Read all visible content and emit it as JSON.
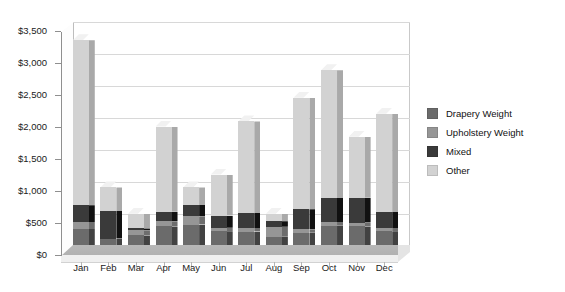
{
  "chart_data": {
    "type": "bar",
    "subtype": "stacked-column-3d",
    "title": "",
    "xlabel": "",
    "ylabel": "",
    "categories": [
      "Jan",
      "Feb",
      "Mar",
      "Apr",
      "May",
      "Jun",
      "Jul",
      "Aug",
      "Sep",
      "Oct",
      "Nov",
      "Dec"
    ],
    "ylim": [
      0,
      3500
    ],
    "ytick_values": [
      0,
      500,
      1000,
      1500,
      2000,
      2500,
      3000,
      3500
    ],
    "ytick_labels": [
      "$0",
      "$500",
      "$1,000",
      "$1,500",
      "$2,000",
      "$2,500",
      "$3,000",
      "$3,500"
    ],
    "grid": true,
    "grid_axis": "y",
    "legend_position": "right",
    "currency_prefix": "$",
    "series": [
      {
        "name": "Drapery Weight",
        "color": "#6b6b6b",
        "values": [
          250,
          100,
          150,
          290,
          320,
          215,
          210,
          130,
          190,
          300,
          290,
          215
        ]
      },
      {
        "name": "Upholstery Weight",
        "color": "#969696",
        "values": [
          110,
          0,
          80,
          80,
          130,
          55,
          55,
          155,
          55,
          60,
          60,
          50
        ]
      },
      {
        "name": "Mixed",
        "color": "#3a3a3a",
        "values": [
          260,
          430,
          30,
          150,
          175,
          190,
          235,
          85,
          315,
          375,
          390,
          250
        ]
      },
      {
        "name": "Other",
        "color": "#d2d2d2",
        "values": [
          2580,
          370,
          230,
          1330,
          275,
          640,
          1430,
          120,
          1740,
          1995,
          950,
          1535
        ]
      }
    ],
    "totals": [
      3200,
      900,
      490,
      1850,
      900,
      1100,
      1930,
      490,
      2300,
      2730,
      1690,
      2050
    ]
  },
  "legend": {
    "items": [
      {
        "label": "Drapery Weight",
        "color": "#6b6b6b"
      },
      {
        "label": "Upholstery Weight",
        "color": "#969696"
      },
      {
        "label": "Mixed",
        "color": "#3a3a3a"
      },
      {
        "label": "Other",
        "color": "#d2d2d2"
      }
    ]
  }
}
